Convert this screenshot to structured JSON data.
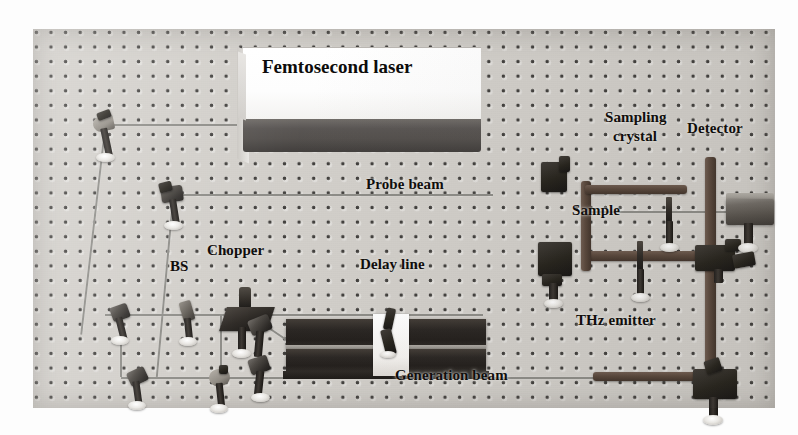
{
  "figure": {
    "type": "photograph-diagram"
  },
  "labels": {
    "femtosecond_laser": "Femtosecond laser",
    "probe_beam": "Probe beam",
    "sampling_crystal_line1": "Sampling",
    "sampling_crystal_line2": "crystal",
    "detector": "Detector",
    "sample": "Sample",
    "bs": "BS",
    "chopper": "Chopper",
    "delay_line": "Delay line",
    "thz_emitter": "THz emitter",
    "generation_beam": "Generation beam"
  },
  "components": {
    "mirror_names": [
      "mirror-top-left",
      "mirror-upper-mid-left",
      "mirror-left-upper",
      "mirror-lower-left",
      "mirror-lower-mid",
      "mirror-bs-left",
      "mirror-after-bs",
      "mirror-before-delay",
      "mirror-delay-retro",
      "mirror-probe-right",
      "mirror-parabolic-upper-left",
      "mirror-parabolic-lower-left",
      "mirror-parabolic-upper-right",
      "mirror-parabolic-lower-right"
    ],
    "optics": [
      "beam-splitter",
      "chopper",
      "delay-line-stage",
      "sample-holder",
      "sampling-crystal",
      "detector-box",
      "thz-emitter-mount"
    ]
  },
  "colors": {
    "breadboard": "#d2cfca",
    "breadboard_hole": "#282624",
    "laser_top": "#ffffff",
    "laser_front": "#514d4a",
    "beam_line": "#8b8a85",
    "thz_beam": "#574539",
    "hardware_dark": "#232019",
    "text": "#100e0c"
  }
}
